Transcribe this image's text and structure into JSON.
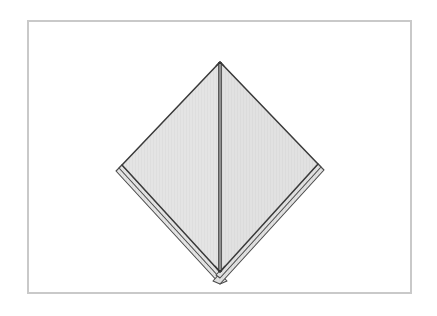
{
  "document": {
    "title": "Origami Fold Diagram",
    "kind": "origami-step-illustration",
    "description": "A square sheet rotated 45 degrees into a diamond, with a vertical centre crease and multiple folded paper layers visible along the two lower edges and at the bottom point."
  },
  "canvas": {
    "width": 437,
    "height": 316,
    "background_color": "#ffffff"
  },
  "frame": {
    "name": "illustration-border",
    "x": 27,
    "y": 20,
    "width": 385,
    "height": 274,
    "border_color": "#c9c9c9",
    "border_width": 2,
    "fill_color": "#ffffff"
  },
  "colors": {
    "paper_fill": "#e3e3e3",
    "paper_fill_right": "#e0e0e0",
    "outline": "#3a3a3a",
    "crease": "#2b2b2b",
    "layer_line": "#4a4a4a",
    "frame_border": "#c9c9c9",
    "page_background": "#ffffff"
  },
  "figure": {
    "name": "folded-paper-diamond",
    "vertices": {
      "top": {
        "x": 220,
        "y": 62
      },
      "left": {
        "x": 122,
        "y": 165
      },
      "right": {
        "x": 318,
        "y": 164
      },
      "bottom": {
        "x": 220,
        "y": 272
      }
    },
    "center_crease": {
      "name": "vertical-centre-crease",
      "from": {
        "x": 220,
        "y": 62
      },
      "to": {
        "x": 220,
        "y": 272
      },
      "style": "double-line",
      "stroke_width": 1.4,
      "gap": 2.2
    },
    "panels": [
      {
        "name": "left-panel",
        "points": "220,62 122,165 220,272",
        "fill": "#e3e3e3"
      },
      {
        "name": "right-panel",
        "points": "220,62 318,164 220,272",
        "fill": "#e0e0e0"
      }
    ],
    "edges": [
      {
        "name": "upper-left-edge",
        "from": {
          "x": 220,
          "y": 62
        },
        "to": {
          "x": 122,
          "y": 165
        },
        "layers": 1
      },
      {
        "name": "upper-right-edge",
        "from": {
          "x": 220,
          "y": 62
        },
        "to": {
          "x": 318,
          "y": 164
        },
        "layers": 1
      },
      {
        "name": "lower-left-edge",
        "from": {
          "x": 122,
          "y": 165
        },
        "to": {
          "x": 220,
          "y": 272
        },
        "layers": 3,
        "note": "stacked paper layers offset outward"
      },
      {
        "name": "lower-right-edge",
        "from": {
          "x": 318,
          "y": 164
        },
        "to": {
          "x": 220,
          "y": 272
        },
        "layers": 3,
        "note": "stacked paper layers offset outward"
      }
    ],
    "layer_offsets": [
      {
        "index": 1,
        "dx": 3,
        "dy": 3
      },
      {
        "index": 2,
        "dx": 6,
        "dy": 6
      }
    ]
  }
}
